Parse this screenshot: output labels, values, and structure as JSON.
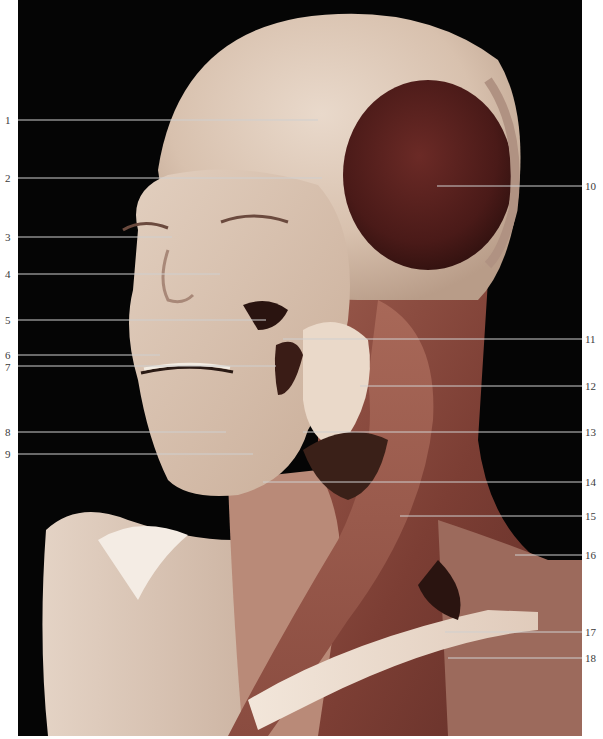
{
  "figure": {
    "colors": {
      "background": "#050505",
      "page": "#ffffff",
      "skin_tissue": "#d9c2b0",
      "fascia_light": "#e6d6c8",
      "temporalis_muscle": "#5a2220",
      "neck_muscle": "#8a4a40",
      "dark_recess": "#2a1410",
      "leader_line": "#cfcfcf",
      "label_text": "#3a3a3a"
    }
  },
  "labels_left": [
    {
      "num": "1",
      "y": 120,
      "x_end": 318
    },
    {
      "num": "2",
      "y": 178,
      "x_end": 322
    },
    {
      "num": "3",
      "y": 237,
      "x_end": 172
    },
    {
      "num": "4",
      "y": 274,
      "x_end": 220
    },
    {
      "num": "5",
      "y": 320,
      "x_end": 266
    },
    {
      "num": "6",
      "y": 355,
      "x_end": 160
    },
    {
      "num": "7",
      "y": 366,
      "x_end": 276
    },
    {
      "num": "8",
      "y": 432,
      "x_end": 226
    },
    {
      "num": "9",
      "y": 454,
      "x_end": 253
    }
  ],
  "labels_right": [
    {
      "num": "10",
      "y": 186,
      "x_start": 437
    },
    {
      "num": "11",
      "y": 339,
      "x_start": 283
    },
    {
      "num": "12",
      "y": 386,
      "x_start": 360
    },
    {
      "num": "13",
      "y": 432,
      "x_start": 303
    },
    {
      "num": "14",
      "y": 482,
      "x_start": 263
    },
    {
      "num": "15",
      "y": 516,
      "x_start": 400
    },
    {
      "num": "16",
      "y": 555,
      "x_start": 515
    },
    {
      "num": "17",
      "y": 632,
      "x_start": 445
    },
    {
      "num": "18",
      "y": 658,
      "x_start": 448
    }
  ]
}
